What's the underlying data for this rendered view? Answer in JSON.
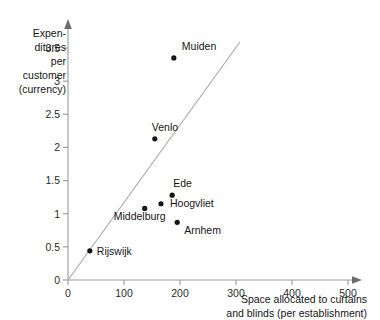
{
  "chart_data": {
    "type": "scatter",
    "title": "",
    "xlabel": "Space allocated to curtains and blinds (per establishment)",
    "ylabel": "Expenditures per customer (currency)",
    "xlim": [
      0,
      500
    ],
    "ylim": [
      0,
      3.5
    ],
    "xticks": [
      "0",
      "100",
      "200",
      "300",
      "400",
      "500"
    ],
    "yticks": [
      "0",
      "0.5",
      "1",
      "1.5",
      "2",
      "2.5",
      "3",
      "3.5"
    ],
    "grid": false,
    "legend": "none",
    "points": [
      {
        "label": "Muiden",
        "x": 189,
        "y": 3.35,
        "label_dx": 8,
        "label_dy": -8
      },
      {
        "label": "Venlo",
        "x": 155,
        "y": 2.13,
        "label_dx": -3,
        "label_dy": -8
      },
      {
        "label": "Ede",
        "x": 186,
        "y": 1.28,
        "label_dx": 1,
        "label_dy": -8
      },
      {
        "label": "Hoogvliet",
        "x": 166,
        "y": 1.15,
        "label_dx": 9,
        "label_dy": 3
      },
      {
        "label": "Middelburg",
        "x": 137,
        "y": 1.08,
        "label_dx": -31,
        "label_dy": 12
      },
      {
        "label": "Arnhem",
        "x": 195,
        "y": 0.87,
        "label_dx": 7,
        "label_dy": 12
      },
      {
        "label": "Rijswijk",
        "x": 39,
        "y": 0.44,
        "label_dx": 7,
        "label_dy": 4
      }
    ],
    "reference_line": {
      "x0": 0,
      "y0": 0,
      "x1": 307,
      "y1": 3.59
    }
  },
  "axis_titles": {
    "y_lines": [
      "Expen-",
      "ditures",
      "per",
      "customer",
      "(currency)"
    ],
    "x_lines": [
      "Space allocated to curtains",
      "and blinds (per establishment)"
    ]
  }
}
